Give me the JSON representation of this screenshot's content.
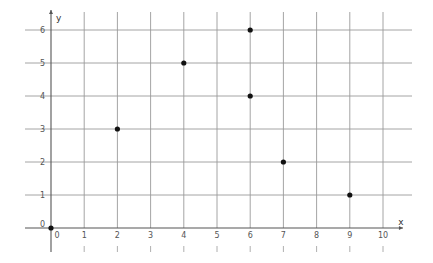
{
  "chart_data": {
    "type": "scatter",
    "title": "",
    "xlabel": "x",
    "ylabel": "y",
    "xlim": [
      -0.8,
      10.8
    ],
    "ylim": [
      -0.7,
      6.5
    ],
    "grid": true,
    "legend": null,
    "x_ticks": [
      0,
      1,
      2,
      3,
      4,
      5,
      6,
      7,
      8,
      9,
      10
    ],
    "y_ticks": [
      0,
      1,
      2,
      3,
      4,
      5,
      6
    ],
    "points": [
      {
        "x": 0,
        "y": 0
      },
      {
        "x": 2,
        "y": 3
      },
      {
        "x": 4,
        "y": 5
      },
      {
        "x": 6,
        "y": 6
      },
      {
        "x": 6,
        "y": 4
      },
      {
        "x": 7,
        "y": 2
      },
      {
        "x": 9,
        "y": 1
      }
    ],
    "series": [
      {
        "name": "points",
        "x": [
          0,
          2,
          4,
          6,
          6,
          7,
          9
        ],
        "y": [
          0,
          3,
          5,
          6,
          4,
          2,
          1
        ]
      }
    ]
  },
  "colors": {
    "grid": "#9a9a9a",
    "axis": "#555555",
    "point": "#111111"
  },
  "layout": {
    "origin_px": [
      51,
      228
    ],
    "unit_x_px": 33.2,
    "unit_y_px": 33,
    "grid_x_extent_px": [
      25,
      412
    ],
    "grid_y_extent_px": [
      12,
      252
    ]
  }
}
